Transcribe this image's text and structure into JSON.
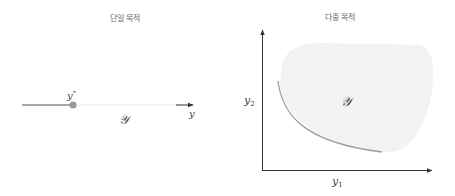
{
  "panels": {
    "single": {
      "title": "단일 목적",
      "optimum_label": "y*",
      "optimum_base": "y",
      "optimum_sup": "*",
      "axis_label": "y",
      "set_label": "𝒴"
    },
    "multi": {
      "title": "다중 목적",
      "x_axis_label_base": "y",
      "x_axis_label_sub": "1",
      "y_axis_label_base": "y",
      "y_axis_label_sub": "2",
      "set_label": "𝒴"
    }
  },
  "colors": {
    "axis": "#333333",
    "feasible_segment": "#888888",
    "optimum_point": "#999999",
    "faint_line": "#eeeeee",
    "region_fill": "#f2f2f2",
    "pareto_front": "#a0a0a0",
    "title": "#666666"
  }
}
